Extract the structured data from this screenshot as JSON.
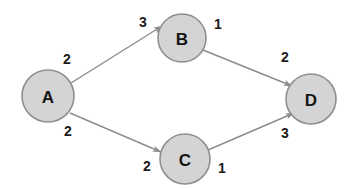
{
  "diagram": {
    "type": "directed-weighted-graph",
    "background_color": "#ffffff",
    "node_fill_color": "#d4d4d4",
    "node_stroke_color": "#8f8f8f",
    "edge_color": "#8c8c8c",
    "label_color": "#151515",
    "nodes": [
      {
        "id": "A",
        "label": "A",
        "cx": 48,
        "cy": 96,
        "r": 26
      },
      {
        "id": "B",
        "label": "B",
        "cx": 182,
        "cy": 38,
        "r": 24
      },
      {
        "id": "C",
        "label": "C",
        "cx": 185,
        "cy": 159,
        "r": 25
      },
      {
        "id": "D",
        "label": "D",
        "cx": 311,
        "cy": 99,
        "r": 25
      }
    ],
    "edges": [
      {
        "id": "A-B",
        "from": "A",
        "to": "B",
        "tail_weight": "2",
        "head_weight": "3",
        "tail_weight_pos": {
          "x": 67,
          "y": 59
        },
        "head_weight_pos": {
          "x": 143,
          "y": 22
        }
      },
      {
        "id": "B-D",
        "from": "B",
        "to": "D",
        "tail_weight": "1",
        "head_weight": "2",
        "tail_weight_pos": {
          "x": 218,
          "y": 24
        },
        "head_weight_pos": {
          "x": 285,
          "y": 57
        }
      },
      {
        "id": "A-C",
        "from": "A",
        "to": "C",
        "tail_weight": "2",
        "head_weight": "2",
        "tail_weight_pos": {
          "x": 68,
          "y": 131
        },
        "head_weight_pos": {
          "x": 147,
          "y": 166
        }
      },
      {
        "id": "C-D",
        "from": "C",
        "to": "D",
        "tail_weight": "1",
        "head_weight": "3",
        "tail_weight_pos": {
          "x": 222,
          "y": 168
        },
        "head_weight_pos": {
          "x": 285,
          "y": 133
        }
      }
    ]
  }
}
